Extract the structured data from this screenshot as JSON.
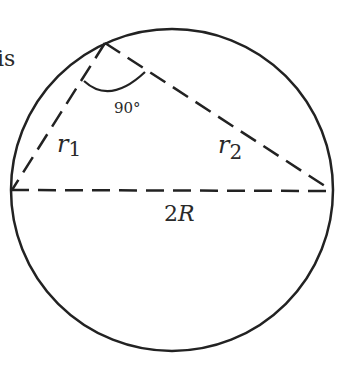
{
  "figure": {
    "partial_text": "is",
    "angle_label": "90°",
    "chord1_label": "r",
    "chord1_sub": "1",
    "chord2_label": "r",
    "chord2_sub": "2",
    "diameter_label_num": "2",
    "diameter_label_var": "R"
  },
  "colors": {
    "stroke": "#222222",
    "text": "#2a2a2a"
  }
}
